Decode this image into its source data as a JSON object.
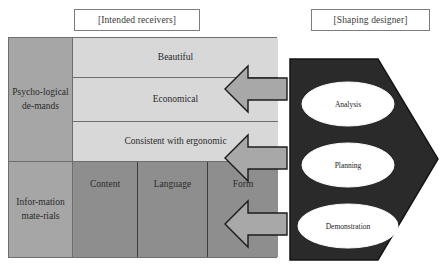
{
  "captions": {
    "receivers": "[Intended receivers]",
    "designer": "[Shaping designer]"
  },
  "matrix": {
    "row_headers": [
      {
        "id": "psychological-demands",
        "label": "Psycho-logical de-mands"
      },
      {
        "id": "information-materials",
        "label": "Infor-mation mate-rials"
      }
    ],
    "upper_rows": [
      {
        "id": "beautiful",
        "label": "Beautiful"
      },
      {
        "id": "economical",
        "label": "Economical"
      },
      {
        "id": "ergonomic",
        "label": "Consistent with ergonomic"
      }
    ],
    "bottom_columns": [
      {
        "id": "content",
        "label": "Content"
      },
      {
        "id": "language",
        "label": "Language"
      },
      {
        "id": "form",
        "label": "Form"
      }
    ]
  },
  "arrows": [
    {
      "id": "arrow-top",
      "direction": "left"
    },
    {
      "id": "arrow-middle",
      "direction": "left"
    },
    {
      "id": "arrow-bottom",
      "direction": "left"
    }
  ],
  "pentagon": {
    "stages": [
      {
        "id": "analysis",
        "label": "Analysis"
      },
      {
        "id": "planning",
        "label": "Planning"
      },
      {
        "id": "demonstration",
        "label": "Demonstration"
      }
    ]
  },
  "colors": {
    "page_background": "#ffffff",
    "row_header_fill": "#a6a6a6",
    "upper_cell_fill": "#d8d8d8",
    "bottom_cell_fill": "#8e8e8e",
    "arrow_fill": "#a8a8a8",
    "pentagon_fill": "#2a2a2a",
    "ellipse_fill": "#ffffff",
    "border": "#6e6e6e",
    "text": "#2b2b2b"
  }
}
